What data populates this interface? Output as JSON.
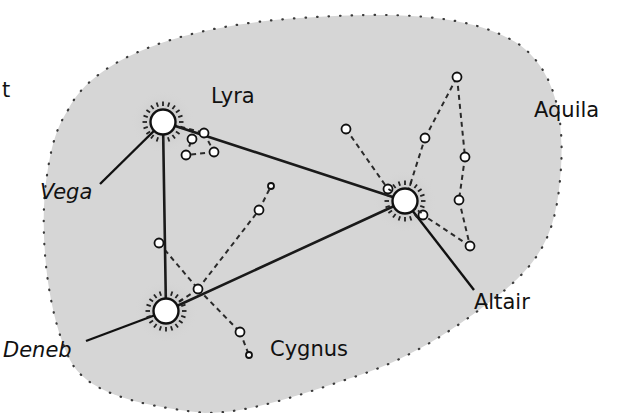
{
  "diagram": {
    "background_color": "#ffffff",
    "region_fill": "#d6d6d6",
    "region_border": "#333333",
    "triangle_line_color": "#1a1a1a",
    "dashed_line_color": "#2a2a2a",
    "star_fill": "#ffffff",
    "star_stroke": "#111111",
    "edge_fragment": "t"
  },
  "constellations": [
    {
      "name": "Lyra",
      "label_x": 211,
      "label_y": 86
    },
    {
      "name": "Aquila",
      "label_x": 534,
      "label_y": 100
    },
    {
      "name": "Cygnus",
      "label_x": 270,
      "label_y": 339
    }
  ],
  "bright_stars": [
    {
      "name": "Vega",
      "x": 163,
      "y": 122,
      "label_x": 40,
      "label_y": 182,
      "leader_end": [
        100,
        184
      ]
    },
    {
      "name": "Deneb",
      "x": 166,
      "y": 311,
      "label_x": 3,
      "label_y": 340,
      "leader_end": [
        86,
        341
      ]
    },
    {
      "name": "Altair",
      "x": 405,
      "y": 201,
      "label_x": 474,
      "label_y": 292,
      "leader_end": [
        474,
        290
      ]
    }
  ],
  "triangle": [
    [
      163,
      122
    ],
    [
      405,
      201
    ],
    [
      166,
      311
    ]
  ],
  "minor_stars": {
    "lyra": [
      [
        204,
        133
      ],
      [
        192,
        139
      ],
      [
        186,
        155
      ],
      [
        214,
        152
      ]
    ],
    "cygnus": [
      [
        159,
        243
      ],
      [
        198,
        289
      ],
      [
        259,
        210
      ],
      [
        271,
        186
      ],
      [
        240,
        332
      ],
      [
        249,
        355
      ]
    ],
    "aquila": [
      [
        346,
        129
      ],
      [
        388,
        189
      ],
      [
        425,
        138
      ],
      [
        457,
        77
      ],
      [
        465,
        157
      ],
      [
        459,
        200
      ],
      [
        470,
        246
      ],
      [
        423,
        215
      ]
    ]
  },
  "edges": {
    "lyra": [
      [
        [
          163,
          122
        ],
        [
          204,
          133
        ]
      ],
      [
        [
          204,
          133
        ],
        [
          214,
          152
        ]
      ],
      [
        [
          214,
          152
        ],
        [
          186,
          155
        ]
      ],
      [
        [
          186,
          155
        ],
        [
          192,
          139
        ]
      ],
      [
        [
          192,
          139
        ],
        [
          204,
          133
        ]
      ]
    ],
    "cygnus": [
      [
        [
          159,
          243
        ],
        [
          198,
          289
        ]
      ],
      [
        [
          198,
          289
        ],
        [
          259,
          210
        ]
      ],
      [
        [
          259,
          210
        ],
        [
          271,
          186
        ]
      ],
      [
        [
          198,
          289
        ],
        [
          240,
          332
        ]
      ],
      [
        [
          240,
          332
        ],
        [
          249,
          355
        ]
      ],
      [
        [
          198,
          289
        ],
        [
          166,
          311
        ]
      ]
    ],
    "aquila": [
      [
        [
          346,
          129
        ],
        [
          388,
          189
        ]
      ],
      [
        [
          405,
          201
        ],
        [
          425,
          138
        ]
      ],
      [
        [
          425,
          138
        ],
        [
          457,
          77
        ]
      ],
      [
        [
          457,
          77
        ],
        [
          465,
          157
        ]
      ],
      [
        [
          465,
          157
        ],
        [
          459,
          200
        ]
      ],
      [
        [
          459,
          200
        ],
        [
          470,
          246
        ]
      ],
      [
        [
          470,
          246
        ],
        [
          423,
          215
        ]
      ],
      [
        [
          423,
          215
        ],
        [
          405,
          201
        ]
      ]
    ]
  }
}
